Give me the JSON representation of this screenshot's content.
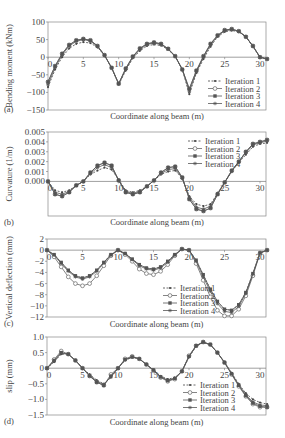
{
  "figure": {
    "x_axis_label": "Coordinate along beam (m)",
    "legend": [
      "Iteration 1",
      "Iteration 2",
      "Iteration 3",
      "Iteration 4"
    ]
  },
  "chart_data": [
    {
      "panel": "(a)",
      "type": "line",
      "ylabel": "Bending moment (kNm)",
      "xlabel": "Coordinate along beam (m)",
      "xlim": [
        0,
        31
      ],
      "ylim": [
        -150,
        100
      ],
      "xticks": [
        0,
        5,
        10,
        15,
        20,
        25,
        30
      ],
      "yticks": [
        100,
        50,
        0,
        -50,
        -100,
        -150
      ],
      "legend_position": "lower right",
      "x": [
        0,
        1,
        2,
        3,
        4,
        5,
        6,
        7,
        8,
        9,
        10,
        11,
        12,
        13,
        14,
        15,
        16,
        17,
        18,
        19,
        20,
        21,
        22,
        23,
        24,
        25,
        26,
        27,
        28,
        29,
        30,
        31
      ],
      "series": [
        {
          "name": "Iteration 1",
          "values": [
            -85,
            -35,
            0,
            25,
            38,
            43,
            40,
            28,
            5,
            -30,
            -78,
            -38,
            -3,
            18,
            32,
            36,
            33,
            22,
            2,
            -35,
            -105,
            -45,
            -5,
            30,
            58,
            72,
            76,
            72,
            58,
            30,
            0,
            -5
          ]
        },
        {
          "name": "Iteration 2",
          "values": [
            -70,
            -25,
            10,
            35,
            48,
            52,
            48,
            32,
            6,
            -30,
            -75,
            -32,
            2,
            25,
            38,
            42,
            38,
            24,
            3,
            -35,
            -90,
            -38,
            3,
            38,
            62,
            77,
            80,
            74,
            58,
            32,
            0,
            -5
          ]
        },
        {
          "name": "Iteration 3",
          "values": [
            -70,
            -25,
            10,
            35,
            48,
            52,
            48,
            32,
            6,
            -30,
            -75,
            -32,
            2,
            25,
            38,
            42,
            38,
            24,
            3,
            -35,
            -90,
            -38,
            3,
            38,
            62,
            77,
            80,
            74,
            58,
            32,
            0,
            -5
          ]
        },
        {
          "name": "Iteration 4",
          "values": [
            -78,
            -30,
            6,
            32,
            45,
            50,
            46,
            30,
            5,
            -30,
            -76,
            -35,
            0,
            22,
            36,
            40,
            36,
            23,
            2,
            -35,
            -98,
            -42,
            0,
            35,
            60,
            75,
            78,
            73,
            58,
            31,
            0,
            -5
          ]
        }
      ]
    },
    {
      "panel": "(b)",
      "type": "line",
      "ylabel": "Curvature (1/m)",
      "xlabel": "Coordinate along beam (m)",
      "xlim": [
        0,
        31
      ],
      "ylim": [
        -0.0035,
        0.005
      ],
      "xticks": [
        0,
        5,
        10,
        15,
        20,
        25,
        30
      ],
      "yticks": [
        "0.005",
        "0.004",
        "0.003",
        "0.002",
        "0.001",
        "0.000"
      ],
      "legend_position": "upper right",
      "x": [
        0,
        1,
        2,
        3,
        4,
        5,
        6,
        7,
        8,
        9,
        10,
        11,
        12,
        13,
        14,
        15,
        16,
        17,
        18,
        19,
        20,
        21,
        22,
        23,
        24,
        25,
        26,
        27,
        28,
        29,
        30,
        31
      ],
      "series": [
        {
          "name": "Iteration 1",
          "values": [
            0.0,
            -0.0009,
            -0.0011,
            -0.0009,
            -0.0004,
            0.0,
            0.0007,
            0.0011,
            0.0014,
            0.0012,
            0.0002,
            -0.0009,
            -0.0011,
            -0.0009,
            -0.0005,
            0.0001,
            0.0007,
            0.001,
            0.0011,
            0.0003,
            -0.0015,
            -0.0023,
            -0.0025,
            -0.0023,
            -0.0012,
            -0.0001,
            0.001,
            0.0019,
            0.0027,
            0.0035,
            0.0038,
            0.0039
          ]
        },
        {
          "name": "Iteration 2",
          "values": [
            0.0,
            -0.0013,
            -0.0015,
            -0.0011,
            -0.0004,
            0.0,
            0.0009,
            0.0016,
            0.0019,
            0.0016,
            0.0001,
            -0.0011,
            -0.0013,
            -0.0011,
            -0.0005,
            0.0001,
            0.0009,
            0.0014,
            0.0015,
            0.0004,
            -0.0018,
            -0.0028,
            -0.003,
            -0.0027,
            -0.0013,
            -0.0001,
            0.0011,
            0.002,
            0.003,
            0.0038,
            0.004,
            0.0042
          ]
        },
        {
          "name": "Iteration 3",
          "values": [
            0.0,
            -0.0013,
            -0.0015,
            -0.0011,
            -0.0004,
            0.0,
            0.0009,
            0.0016,
            0.0019,
            0.0016,
            0.0001,
            -0.0011,
            -0.0013,
            -0.0011,
            -0.0005,
            0.0001,
            0.0009,
            0.0014,
            0.0015,
            0.0004,
            -0.0018,
            -0.0028,
            -0.003,
            -0.0027,
            -0.0013,
            -0.0001,
            0.0011,
            0.002,
            0.003,
            0.0038,
            0.004,
            0.0042
          ]
        },
        {
          "name": "Iteration 4",
          "values": [
            0.0,
            -0.0011,
            -0.0013,
            -0.001,
            -0.0004,
            0.0,
            0.0008,
            0.0014,
            0.0017,
            0.0014,
            0.0001,
            -0.001,
            -0.0012,
            -0.001,
            -0.0005,
            0.0001,
            0.0008,
            0.0012,
            0.0013,
            0.0003,
            -0.0016,
            -0.0026,
            -0.0028,
            -0.0025,
            -0.0012,
            -0.0001,
            0.001,
            0.002,
            0.0029,
            0.0037,
            0.0039,
            0.0041
          ]
        }
      ]
    },
    {
      "panel": "(c)",
      "type": "line",
      "ylabel": "Vertical deflection (mm)",
      "xlabel": "Coordinate along beam (m)",
      "xlim": [
        0,
        31
      ],
      "ylim": [
        -12,
        2
      ],
      "xticks": [
        0,
        5,
        10,
        15,
        20,
        25,
        30
      ],
      "yticks": [
        2,
        0,
        -2,
        -4,
        -6,
        -8,
        -10,
        -12
      ],
      "legend_position": "lower center",
      "x": [
        0,
        1,
        2,
        3,
        4,
        5,
        6,
        7,
        8,
        9,
        10,
        11,
        12,
        13,
        14,
        15,
        16,
        17,
        18,
        19,
        20,
        21,
        22,
        23,
        24,
        25,
        26,
        27,
        28,
        29,
        30,
        31
      ],
      "series": [
        {
          "name": "Iteration 1",
          "values": [
            0,
            -0.8,
            -2.2,
            -3.6,
            -4.6,
            -5.0,
            -4.6,
            -3.6,
            -2.2,
            -0.8,
            0,
            -0.6,
            -1.6,
            -2.6,
            -3.2,
            -3.4,
            -3.0,
            -2.0,
            -0.8,
            0.2,
            0,
            -1.8,
            -4.4,
            -7.0,
            -9.2,
            -10.6,
            -10.8,
            -9.8,
            -7.6,
            -4.2,
            -0.5,
            0
          ]
        },
        {
          "name": "Iteration 2",
          "values": [
            0,
            -1.2,
            -3.0,
            -4.8,
            -6.0,
            -6.4,
            -6.0,
            -4.6,
            -2.8,
            -1.0,
            0,
            -0.8,
            -2.0,
            -3.4,
            -4.2,
            -4.4,
            -3.8,
            -2.6,
            -1.0,
            0.2,
            0,
            -2.4,
            -5.4,
            -8.4,
            -10.8,
            -11.8,
            -11.8,
            -10.6,
            -8.2,
            -4.6,
            -0.6,
            0
          ]
        },
        {
          "name": "Iteration 3",
          "values": [
            0,
            -0.8,
            -2.2,
            -3.6,
            -4.6,
            -5.0,
            -4.6,
            -3.6,
            -2.2,
            -0.8,
            0,
            -0.6,
            -1.6,
            -2.6,
            -3.2,
            -3.4,
            -3.0,
            -2.0,
            -0.8,
            0.2,
            0,
            -1.8,
            -4.4,
            -7.0,
            -9.2,
            -10.6,
            -10.8,
            -9.8,
            -7.6,
            -4.2,
            -0.5,
            0
          ]
        },
        {
          "name": "Iteration 4",
          "values": [
            0,
            -0.9,
            -2.4,
            -3.8,
            -4.8,
            -5.2,
            -4.8,
            -3.8,
            -2.3,
            -0.9,
            0,
            -0.6,
            -1.7,
            -2.8,
            -3.4,
            -3.6,
            -3.2,
            -2.2,
            -0.9,
            0.2,
            0,
            -2.0,
            -4.8,
            -7.4,
            -9.6,
            -11.0,
            -11.2,
            -10.1,
            -7.8,
            -4.3,
            -0.5,
            0
          ]
        }
      ]
    },
    {
      "panel": "(d)",
      "type": "line",
      "ylabel": "slip (mm)",
      "xlabel": "Coordinate along beam (m)",
      "xlim": [
        0,
        31
      ],
      "ylim": [
        -1.5,
        1.0
      ],
      "xticks": [
        0,
        5,
        10,
        15,
        20,
        25,
        30
      ],
      "yticks": [
        "1.0",
        "0.5",
        "0",
        "-0.5",
        "-1.0",
        "-1.5"
      ],
      "legend_position": "lower right",
      "x": [
        0,
        1,
        2,
        3,
        4,
        5,
        6,
        7,
        8,
        9,
        10,
        11,
        12,
        13,
        14,
        15,
        16,
        17,
        18,
        19,
        20,
        21,
        22,
        23,
        24,
        25,
        26,
        27,
        28,
        29,
        30,
        31
      ],
      "series": [
        {
          "name": "Iteration 1",
          "values": [
            0,
            0.2,
            0.45,
            0.45,
            0.25,
            0.0,
            -0.2,
            -0.38,
            -0.5,
            -0.3,
            0.0,
            0.25,
            0.35,
            0.3,
            0.12,
            -0.05,
            -0.25,
            -0.35,
            -0.3,
            -0.1,
            0.35,
            0.7,
            0.82,
            0.75,
            0.5,
            0.2,
            -0.15,
            -0.5,
            -0.8,
            -1.0,
            -1.1,
            -1.15
          ]
        },
        {
          "name": "Iteration 2",
          "values": [
            0,
            0.28,
            0.55,
            0.45,
            0.25,
            0.0,
            -0.25,
            -0.45,
            -0.55,
            -0.2,
            0.0,
            0.3,
            0.38,
            0.3,
            0.12,
            -0.08,
            -0.3,
            -0.42,
            -0.35,
            -0.1,
            0.4,
            0.72,
            0.84,
            0.76,
            0.5,
            0.18,
            -0.2,
            -0.58,
            -0.9,
            -1.15,
            -1.25,
            -1.25
          ]
        },
        {
          "name": "Iteration 3",
          "values": [
            0,
            0.25,
            0.5,
            0.45,
            0.25,
            0.0,
            -0.25,
            -0.45,
            -0.55,
            -0.25,
            0.0,
            0.28,
            0.36,
            0.3,
            0.12,
            -0.06,
            -0.28,
            -0.4,
            -0.33,
            -0.1,
            0.38,
            0.72,
            0.84,
            0.76,
            0.5,
            0.18,
            -0.18,
            -0.55,
            -0.88,
            -1.12,
            -1.22,
            -1.25
          ]
        },
        {
          "name": "Iteration 4",
          "values": [
            0,
            0.22,
            0.48,
            0.45,
            0.25,
            0.0,
            -0.22,
            -0.42,
            -0.52,
            -0.28,
            0.0,
            0.27,
            0.36,
            0.3,
            0.12,
            -0.06,
            -0.27,
            -0.38,
            -0.32,
            -0.1,
            0.37,
            0.71,
            0.83,
            0.75,
            0.5,
            0.19,
            -0.17,
            -0.53,
            -0.85,
            -1.08,
            -1.18,
            -1.2
          ]
        }
      ]
    }
  ]
}
